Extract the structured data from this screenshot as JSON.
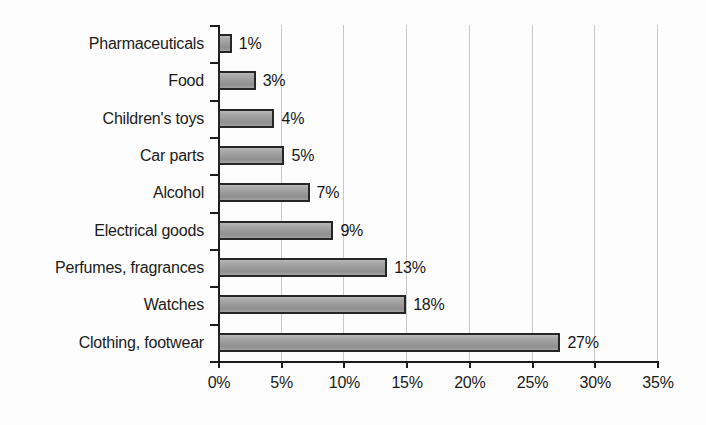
{
  "chart_data": {
    "type": "bar",
    "orientation": "horizontal",
    "title": "",
    "xlabel": "",
    "ylabel": "",
    "xlim": [
      0,
      35
    ],
    "xtick_labels": [
      "0%",
      "5%",
      "10%",
      "15%",
      "20%",
      "25%",
      "30%",
      "35%"
    ],
    "xticks": [
      0,
      5,
      10,
      15,
      20,
      25,
      30,
      35
    ],
    "grid": "vertical",
    "legend": "none",
    "categories": [
      "Pharmaceuticals",
      "Food",
      "Children's toys",
      "Car parts",
      "Alcohol",
      "Electrical goods",
      "Perfumes, fragrances",
      "Watches",
      "Clothing, footwear"
    ],
    "values": [
      1,
      3,
      4,
      5,
      7,
      9,
      13,
      18,
      27
    ],
    "bar_lengths_percent": [
      1.1,
      3.0,
      4.5,
      5.3,
      7.3,
      9.2,
      13.5,
      15.0,
      27.3
    ],
    "data_labels": [
      "1%",
      "3%",
      "4%",
      "5%",
      "7%",
      "9%",
      "13%",
      "18%",
      "27%"
    ],
    "series": [
      {
        "name": "",
        "values": [
          1,
          3,
          4,
          5,
          7,
          9,
          13,
          18,
          27
        ]
      }
    ]
  },
  "colors": {
    "bar_fill": "#9b9b9b",
    "bar_border": "#262626",
    "gridline": "#c9c9c9",
    "axis": "#1c1c1c",
    "text": "#1a1a1a",
    "background": "#fdfdfd"
  }
}
